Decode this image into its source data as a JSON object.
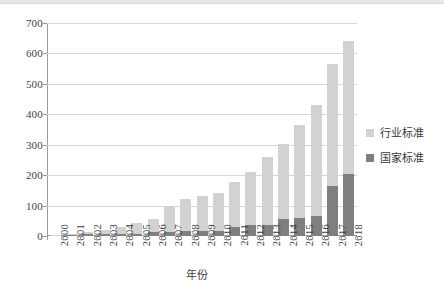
{
  "chart_data": {
    "type": "bar",
    "stacked": true,
    "title": "",
    "xlabel": "年份",
    "ylabel": "",
    "ylim": [
      0,
      700
    ],
    "ytick_step": 100,
    "yticks": [
      0,
      100,
      200,
      300,
      400,
      500,
      600,
      700
    ],
    "grid": true,
    "legend_position": "right",
    "categories": [
      "2000",
      "2001",
      "2002",
      "2003",
      "2004",
      "2005",
      "2006",
      "2007",
      "2008",
      "2009",
      "2010",
      "2011",
      "2012",
      "2013",
      "2014",
      "2015",
      "2016",
      "2017",
      "2018"
    ],
    "series": [
      {
        "name": "国家标准",
        "color": "#7f7f7f",
        "values": [
          2,
          3,
          5,
          6,
          8,
          8,
          13,
          13,
          18,
          18,
          18,
          30,
          37,
          37,
          55,
          58,
          66,
          164,
          205
        ]
      },
      {
        "name": "行业标准",
        "color": "#d2d2d2",
        "values": [
          1,
          4,
          8,
          13,
          23,
          36,
          44,
          86,
          103,
          112,
          123,
          148,
          174,
          222,
          249,
          307,
          363,
          402,
          435
        ]
      }
    ],
    "totals": [
      3,
      7,
      13,
      19,
      31,
      44,
      57,
      99,
      121,
      130,
      141,
      178,
      211,
      259,
      304,
      365,
      429,
      566,
      640
    ]
  },
  "legend": {
    "items": [
      {
        "label": "行业标准",
        "swatch": "legend-swatch-industry"
      },
      {
        "label": "国家标准",
        "swatch": "legend-swatch-national"
      }
    ]
  },
  "axes": {
    "x_title": "年份",
    "y_tick_labels": [
      "700",
      "600",
      "500",
      "400",
      "300",
      "200",
      "100",
      "0"
    ],
    "x_tick_labels": [
      "2000",
      "2001",
      "2002",
      "2003",
      "2004",
      "2005",
      "2006",
      "2007",
      "2008",
      "2009",
      "2010",
      "2011",
      "2012",
      "2013",
      "2014",
      "2015",
      "2016",
      "2017",
      "2018"
    ]
  },
  "colors": {
    "industry": "#d2d2d2",
    "national": "#7f7f7f",
    "gridline": "#d6d6d6",
    "axis": "#9a9a9a",
    "text": "#3a3a3a",
    "background": "#ffffff"
  }
}
